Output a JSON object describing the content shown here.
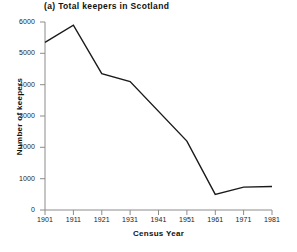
{
  "figure": {
    "panel_label": "(a)",
    "title": "(a) Total keepers in Scotland"
  },
  "axis_titles": {
    "x": "Census Year",
    "y": "Number of keepers"
  },
  "ticks": {
    "y": [
      "0",
      "1000",
      "2000",
      "3000",
      "4000",
      "5000",
      "6000"
    ],
    "x": [
      "1901",
      "1911",
      "1921",
      "1931",
      "1941",
      "1951",
      "1961",
      "1971",
      "1981"
    ]
  },
  "colors": {
    "line": "#1a1a1a",
    "axis": "#8c8c8c",
    "text": "#111111",
    "background": "#ffffff"
  },
  "chart_data": {
    "type": "line",
    "title": "(a) Total keepers in Scotland",
    "xlabel": "Census Year",
    "ylabel": "Number of keepers",
    "x": [
      1901,
      1911,
      1921,
      1931,
      1941,
      1951,
      1961,
      1971,
      1981
    ],
    "categories": [
      "1901",
      "1911",
      "1921",
      "1931",
      "1941",
      "1951",
      "1961",
      "1971",
      "1981"
    ],
    "series": [
      {
        "name": "Total keepers in Scotland",
        "values": [
          5350,
          5900,
          4350,
          4100,
          null,
          2200,
          500,
          730,
          750
        ]
      }
    ],
    "values": [
      5350,
      5900,
      4350,
      4100,
      null,
      2200,
      500,
      730,
      750
    ],
    "xlim": [
      1901,
      1981
    ],
    "ylim": [
      0,
      6000
    ],
    "ytick_values": [
      0,
      1000,
      2000,
      3000,
      4000,
      5000,
      6000
    ],
    "xtick_values": [
      1901,
      1911,
      1921,
      1931,
      1941,
      1951,
      1961,
      1971,
      1981
    ],
    "grid": false,
    "legend": false,
    "markers": false
  }
}
